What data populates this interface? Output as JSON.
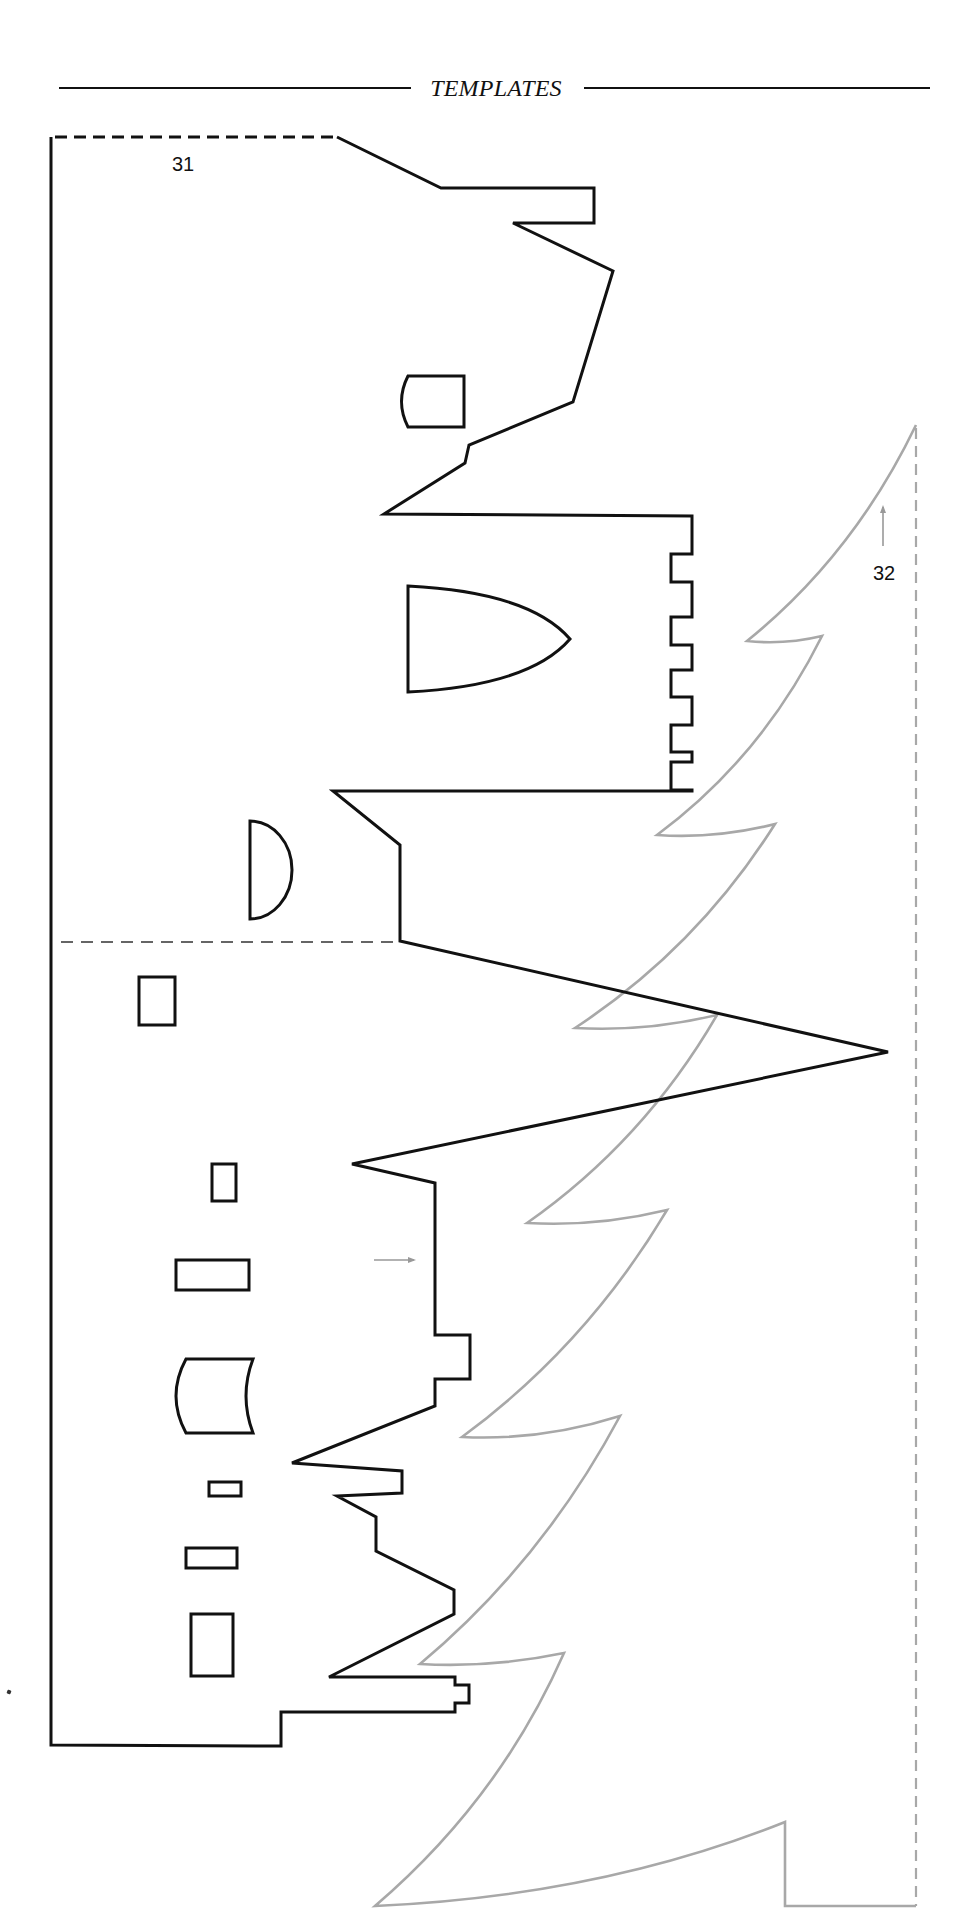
{
  "header": {
    "title": "TEMPLATES"
  },
  "templates": [
    {
      "id": "31",
      "label": "31",
      "name": "castle-silhouette",
      "stroke_color": "#111111",
      "outline_points": [
        [
          337,
          137
        ],
        [
          441,
          188
        ],
        [
          594,
          188
        ],
        [
          594,
          223
        ],
        [
          513,
          223
        ],
        [
          613,
          271
        ],
        [
          573,
          402
        ],
        [
          469,
          445
        ],
        [
          465,
          463
        ],
        [
          384,
          514
        ],
        [
          692,
          516
        ],
        [
          692,
          554
        ],
        [
          671,
          554
        ],
        [
          671,
          582
        ],
        [
          692,
          582
        ],
        [
          692,
          617
        ],
        [
          671,
          617
        ],
        [
          671,
          645
        ],
        [
          692,
          645
        ],
        [
          692,
          670
        ],
        [
          671,
          670
        ],
        [
          671,
          697
        ],
        [
          692,
          697
        ],
        [
          692,
          725
        ],
        [
          671,
          725
        ],
        [
          671,
          752
        ],
        [
          692,
          752
        ],
        [
          692,
          762
        ],
        [
          671,
          762
        ],
        [
          671,
          790
        ],
        [
          692,
          790
        ],
        [
          692,
          791
        ],
        [
          333,
          791
        ],
        [
          400,
          845
        ],
        [
          400,
          941
        ],
        [
          888,
          1052
        ],
        [
          352,
          1164
        ],
        [
          435,
          1183
        ],
        [
          435,
          1335
        ],
        [
          470,
          1335
        ],
        [
          470,
          1379
        ],
        [
          435,
          1379
        ],
        [
          435,
          1406
        ],
        [
          292,
          1463
        ],
        [
          402,
          1471
        ],
        [
          402,
          1493
        ],
        [
          337,
          1496
        ],
        [
          376,
          1517
        ],
        [
          376,
          1551
        ],
        [
          454,
          1590
        ],
        [
          454,
          1614
        ],
        [
          329,
          1677
        ],
        [
          455,
          1677
        ],
        [
          455,
          1685
        ],
        [
          469,
          1685
        ],
        [
          469,
          1703
        ],
        [
          455,
          1703
        ],
        [
          455,
          1712
        ],
        [
          281,
          1712
        ],
        [
          281,
          1746
        ],
        [
          51,
          1745
        ],
        [
          51,
          137
        ]
      ],
      "fold_lines": [
        {
          "name": "top-fold-line",
          "from": [
            55,
            137
          ],
          "to": [
            337,
            137
          ]
        },
        {
          "name": "middle-fold-line",
          "from": [
            61,
            942
          ],
          "to": [
            397,
            942
          ]
        }
      ],
      "windows": [
        {
          "name": "window-arched-upper",
          "shape": "curved-left",
          "x": 401,
          "y": 376,
          "w": 63,
          "h": 51
        },
        {
          "name": "window-gothic",
          "shape": "gothic",
          "x": 408,
          "y": 586,
          "w": 162,
          "h": 106
        },
        {
          "name": "window-half-moon",
          "shape": "half-moon",
          "x": 250,
          "y": 821,
          "w": 42,
          "h": 98
        },
        {
          "name": "window-rect-1",
          "shape": "rect",
          "x": 139,
          "y": 977,
          "w": 36,
          "h": 48
        },
        {
          "name": "window-rect-2",
          "shape": "rect",
          "x": 212,
          "y": 1164,
          "w": 24,
          "h": 37
        },
        {
          "name": "window-rect-3",
          "shape": "rect",
          "x": 176,
          "y": 1260,
          "w": 73,
          "h": 30
        },
        {
          "name": "window-curved-sides",
          "shape": "curved-sides",
          "x": 176,
          "y": 1359,
          "w": 77,
          "h": 74
        },
        {
          "name": "window-rect-4",
          "shape": "rect",
          "x": 209,
          "y": 1482,
          "w": 32,
          "h": 14
        },
        {
          "name": "window-rect-5",
          "shape": "rect",
          "x": 186,
          "y": 1548,
          "w": 51,
          "h": 20
        },
        {
          "name": "window-rect-6",
          "shape": "rect",
          "x": 191,
          "y": 1614,
          "w": 42,
          "h": 62
        }
      ],
      "arrow": {
        "name": "placement-arrow-right",
        "from": [
          374,
          1260
        ],
        "to": [
          414,
          1260
        ],
        "color": "#999999"
      }
    },
    {
      "id": "32",
      "label": "32",
      "name": "tree-silhouette",
      "stroke_color": "#a8a8a8",
      "top": [
        916,
        425
      ],
      "tiers": [
        {
          "inner": [
            747,
            641
          ],
          "tip": [
            822,
            636
          ]
        },
        {
          "inner": [
            657,
            835
          ],
          "tip": [
            775,
            824
          ]
        },
        {
          "inner": [
            575,
            1028
          ],
          "tip": [
            717,
            1015
          ]
        },
        {
          "inner": [
            527,
            1223
          ],
          "tip": [
            667,
            1210
          ]
        },
        {
          "inner": [
            462,
            1437
          ],
          "tip": [
            620,
            1416
          ]
        },
        {
          "inner": [
            420,
            1664
          ],
          "tip": [
            564,
            1653
          ]
        }
      ],
      "base": {
        "left": [
          375,
          1906
        ],
        "trunk_top": [
          785,
          1822
        ],
        "trunk_bottom": [
          785,
          1906
        ],
        "right": [
          916,
          1906
        ]
      },
      "fold_line": {
        "name": "tree-fold-line",
        "from": [
          916,
          428
        ],
        "to": [
          916,
          1906
        ]
      },
      "arrow": {
        "name": "placement-arrow-up",
        "from": [
          883,
          546
        ],
        "to": [
          883,
          507
        ],
        "color": "#999999"
      }
    }
  ]
}
